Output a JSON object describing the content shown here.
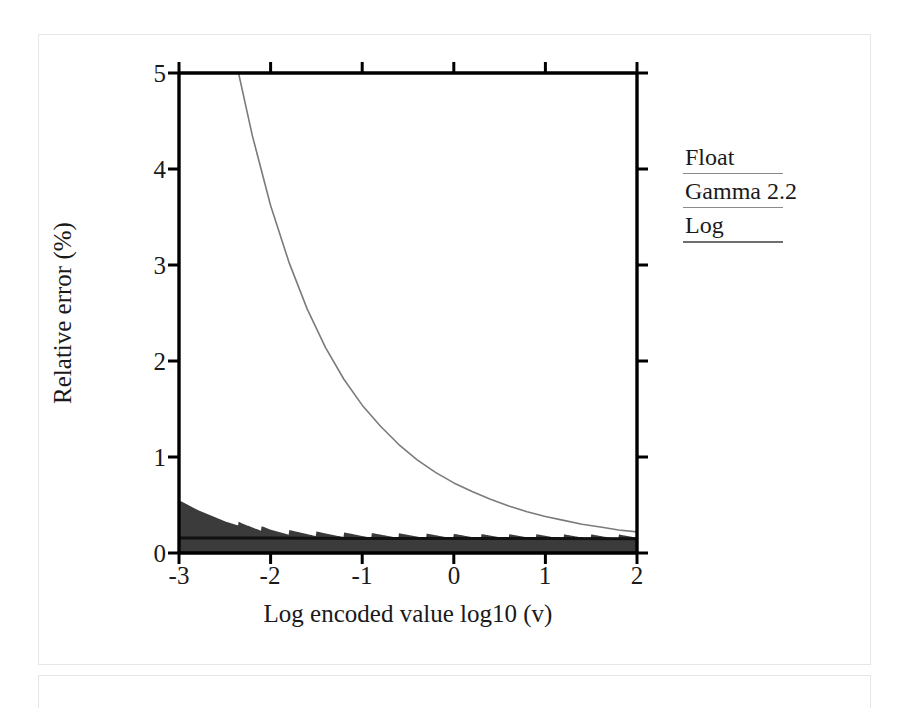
{
  "page": {
    "background": "#ffffff",
    "panel_border_color": "#e6e6e6"
  },
  "figure": {
    "frame_color": "#000000",
    "plot_left_px": 179,
    "plot_right_px": 637,
    "plot_top_px": 73,
    "plot_bottom_px": 553
  },
  "legend": {
    "position": "right-outside",
    "entries": [
      {
        "label": "Float",
        "color": "#3a3a3a",
        "style": "filled-histogram"
      },
      {
        "label": "Gamma 2.2",
        "color": "#7a7a7a",
        "style": "thin-line"
      },
      {
        "label": "Log",
        "color": "#111111",
        "style": "solid-line"
      }
    ]
  },
  "chart_data": {
    "type": "line",
    "title": "",
    "subtitle": "",
    "xlabel": "Log encoded value log10 (v)",
    "ylabel": "Relative error (%)",
    "xlim": [
      -3,
      2
    ],
    "ylim": [
      0,
      5
    ],
    "xticks": [
      -3,
      -2,
      -1,
      0,
      1,
      2
    ],
    "xticklabels": [
      "-3",
      "-2",
      "-1",
      "0",
      "1",
      "2"
    ],
    "yticks": [
      0,
      1,
      2,
      3,
      4,
      5
    ],
    "yticklabels": [
      "0",
      "1",
      "2",
      "3",
      "4",
      "5"
    ],
    "grid": false,
    "tick_direction": "out",
    "frame": "box",
    "series": [
      {
        "name": "Float",
        "color": "#3a3a3a",
        "style": "filled-area-sawtooth",
        "note": "Dark filled band; decays from ~0.55% at log10(v) = -3 to a ~0.14% baseline with a periodic sawtooth ripple (one tooth per mantissa/exponent step).",
        "x": [
          -3.0,
          -2.9,
          -2.8,
          -2.7,
          -2.6,
          -2.5,
          -2.4,
          -2.3,
          -2.2,
          -2.1,
          -2.0,
          -1.9,
          -1.8,
          -1.7,
          -1.6,
          -1.5,
          -1.4,
          -1.2,
          -1.0,
          -0.8,
          -0.6,
          -0.4,
          -0.2,
          0.0,
          0.3,
          0.6,
          0.9,
          1.2,
          1.5,
          1.8,
          2.0
        ],
        "y": [
          0.55,
          0.5,
          0.45,
          0.41,
          0.37,
          0.33,
          0.3,
          0.27,
          0.25,
          0.23,
          0.21,
          0.2,
          0.19,
          0.185,
          0.18,
          0.175,
          0.17,
          0.165,
          0.16,
          0.158,
          0.156,
          0.154,
          0.152,
          0.15,
          0.148,
          0.147,
          0.146,
          0.145,
          0.144,
          0.143,
          0.142
        ],
        "sawtooth_period_decades": 0.3,
        "sawtooth_amplitude": 0.05
      },
      {
        "name": "Gamma 2.2",
        "color": "#7a7a7a",
        "style": "thin-line",
        "note": "Smooth exponential-like decay; exits the top of the frame (5%) near log10(v) = -2.35 and falls to ~0.2% by log10(v) = 2.",
        "x": [
          -2.35,
          -2.2,
          -2.0,
          -1.8,
          -1.6,
          -1.4,
          -1.2,
          -1.0,
          -0.8,
          -0.6,
          -0.4,
          -0.2,
          0.0,
          0.2,
          0.4,
          0.6,
          0.8,
          1.0,
          1.2,
          1.4,
          1.6,
          1.8,
          2.0
        ],
        "y": [
          5.0,
          4.35,
          3.62,
          3.03,
          2.54,
          2.14,
          1.81,
          1.54,
          1.32,
          1.13,
          0.97,
          0.84,
          0.73,
          0.64,
          0.56,
          0.49,
          0.43,
          0.38,
          0.34,
          0.3,
          0.27,
          0.24,
          0.22
        ]
      },
      {
        "name": "Log",
        "color": "#111111",
        "style": "solid-line",
        "note": "Essentially constant relative error across the whole range.",
        "x": [
          -3.0,
          -2.0,
          -1.0,
          0.0,
          1.0,
          2.0
        ],
        "y": [
          0.155,
          0.155,
          0.152,
          0.15,
          0.15,
          0.148
        ]
      }
    ]
  }
}
